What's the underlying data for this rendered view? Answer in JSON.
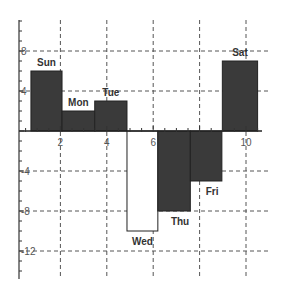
{
  "chart_data": {
    "type": "bar",
    "title": "",
    "xlabel": "",
    "ylabel": "",
    "categories": [
      "Sun",
      "Mon",
      "Tue",
      "Wed",
      "Thu",
      "Fri",
      "Sat"
    ],
    "values": [
      6,
      2,
      3,
      -10,
      -8,
      -5,
      7
    ],
    "bar_x_ranges": [
      [
        0.73,
        2.07
      ],
      [
        2.07,
        3.48
      ],
      [
        3.48,
        4.87
      ],
      [
        4.87,
        6.2
      ],
      [
        6.2,
        7.6
      ],
      [
        7.6,
        8.96
      ],
      [
        8.98,
        10.5
      ]
    ],
    "bar_fills": [
      "#3a3a3a",
      "#3a3a3a",
      "#3a3a3a",
      "#ffffff",
      "#3a3a3a",
      "#3a3a3a",
      "#3a3a3a"
    ],
    "x_ticks": [
      2,
      4,
      6,
      10
    ],
    "x_gridlines": [
      2,
      4,
      6,
      8,
      10
    ],
    "y_ticks": [
      8,
      4,
      -4,
      -8,
      -12
    ],
    "y_gridlines": [
      8,
      4,
      -4,
      -8,
      -12
    ],
    "xlim": [
      0,
      11
    ],
    "ylim": [
      -13,
      11
    ],
    "grid": true,
    "legend": null
  }
}
